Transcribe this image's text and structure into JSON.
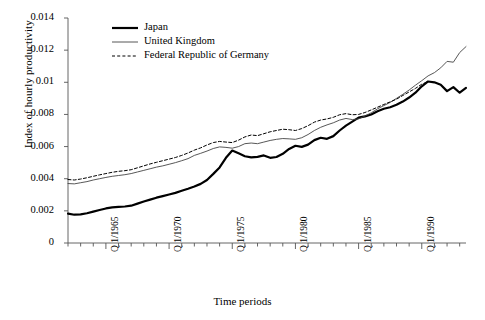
{
  "chart_data": {
    "type": "line",
    "title": "",
    "xlabel": "Time periods",
    "ylabel": "Index of hourly productivity",
    "ylim": [
      0,
      0.014
    ],
    "yticks": [
      "0",
      "0.002",
      "0.004",
      "0.006",
      "0.008",
      "0.01",
      "0.012",
      "0.014"
    ],
    "ytick_values": [
      0,
      0.002,
      0.004,
      0.006,
      0.008,
      0.01,
      0.012,
      0.014
    ],
    "xlim": [
      1962.0,
      1993.5
    ],
    "xticks": [
      "Q 1/1965",
      "Q 1/1970",
      "Q 1/1975",
      "Q 1/1980",
      "Q 1/1985",
      "Q 1/1990"
    ],
    "xtick_values": [
      1965,
      1970,
      1975,
      1980,
      1985,
      1990
    ],
    "minor_xtick_interval": 1,
    "grid": false,
    "legend_position": "top-left-inside",
    "series": [
      {
        "name": "Japan",
        "style": "solid-thick",
        "color": "#000000",
        "width": 2.2,
        "x": [
          1962.0,
          1962.5,
          1963.0,
          1963.5,
          1964.0,
          1964.5,
          1965.0,
          1965.5,
          1966.0,
          1966.5,
          1967.0,
          1967.5,
          1968.0,
          1968.5,
          1969.0,
          1969.5,
          1970.0,
          1970.5,
          1971.0,
          1971.5,
          1972.0,
          1972.5,
          1973.0,
          1973.5,
          1974.0,
          1974.5,
          1975.0,
          1975.5,
          1976.0,
          1976.5,
          1977.0,
          1977.5,
          1978.0,
          1978.5,
          1979.0,
          1979.5,
          1980.0,
          1980.5,
          1981.0,
          1981.5,
          1982.0,
          1982.5,
          1983.0,
          1983.5,
          1984.0,
          1984.5,
          1985.0,
          1985.5,
          1986.0,
          1986.5,
          1987.0,
          1987.5,
          1988.0,
          1988.5,
          1989.0,
          1989.5,
          1990.0,
          1990.5,
          1991.0,
          1991.5,
          1992.0,
          1992.5,
          1993.0,
          1993.5
        ],
        "y": [
          0.00183,
          0.00176,
          0.00178,
          0.00185,
          0.00195,
          0.00205,
          0.00215,
          0.00222,
          0.00225,
          0.00227,
          0.00232,
          0.00245,
          0.00258,
          0.0027,
          0.00282,
          0.00292,
          0.00302,
          0.00312,
          0.00325,
          0.00338,
          0.00352,
          0.00368,
          0.00392,
          0.0043,
          0.0047,
          0.0053,
          0.00575,
          0.00558,
          0.0054,
          0.00533,
          0.00536,
          0.00545,
          0.0053,
          0.00535,
          0.00555,
          0.00585,
          0.00605,
          0.00598,
          0.00612,
          0.0064,
          0.00655,
          0.00648,
          0.00665,
          0.007,
          0.0073,
          0.00755,
          0.0078,
          0.00788,
          0.008,
          0.0082,
          0.00835,
          0.00845,
          0.0086,
          0.0088,
          0.00905,
          0.00935,
          0.00975,
          0.01005,
          0.01,
          0.00985,
          0.00945,
          0.0097,
          0.00935,
          0.00965
        ]
      },
      {
        "name": "United Kingdom",
        "style": "solid-thin",
        "color": "#444444",
        "width": 0.9,
        "x": [
          1962.0,
          1962.5,
          1963.0,
          1963.5,
          1964.0,
          1964.5,
          1965.0,
          1965.5,
          1966.0,
          1966.5,
          1967.0,
          1967.5,
          1968.0,
          1968.5,
          1969.0,
          1969.5,
          1970.0,
          1970.5,
          1971.0,
          1971.5,
          1972.0,
          1972.5,
          1973.0,
          1973.5,
          1974.0,
          1974.5,
          1975.0,
          1975.5,
          1976.0,
          1976.5,
          1977.0,
          1977.5,
          1978.0,
          1978.5,
          1979.0,
          1979.5,
          1980.0,
          1980.5,
          1981.0,
          1981.5,
          1982.0,
          1982.5,
          1983.0,
          1983.5,
          1984.0,
          1984.5,
          1985.0,
          1985.5,
          1986.0,
          1986.5,
          1987.0,
          1987.5,
          1988.0,
          1988.5,
          1989.0,
          1989.5,
          1990.0,
          1990.5,
          1991.0,
          1991.5,
          1992.0,
          1992.5,
          1993.0,
          1993.5
        ],
        "y": [
          0.0037,
          0.00368,
          0.00375,
          0.00382,
          0.00392,
          0.004,
          0.00408,
          0.00415,
          0.0042,
          0.00425,
          0.00432,
          0.00442,
          0.00452,
          0.00462,
          0.00472,
          0.0048,
          0.0049,
          0.005,
          0.00512,
          0.00525,
          0.00545,
          0.00558,
          0.00572,
          0.00588,
          0.00598,
          0.00595,
          0.0059,
          0.006,
          0.00618,
          0.00622,
          0.00618,
          0.00628,
          0.00638,
          0.00645,
          0.0065,
          0.00648,
          0.00645,
          0.00655,
          0.00675,
          0.007,
          0.0072,
          0.00735,
          0.00748,
          0.00765,
          0.00775,
          0.00768,
          0.00772,
          0.0079,
          0.0081,
          0.00835,
          0.00855,
          0.00875,
          0.009,
          0.00925,
          0.00952,
          0.00982,
          0.0101,
          0.0104,
          0.0106,
          0.0109,
          0.0113,
          0.01125,
          0.01185,
          0.01222
        ]
      },
      {
        "name": "Federal Republic of Germany",
        "style": "dashed",
        "color": "#000000",
        "width": 1.0,
        "x": [
          1962.0,
          1962.5,
          1963.0,
          1963.5,
          1964.0,
          1964.5,
          1965.0,
          1965.5,
          1966.0,
          1966.5,
          1967.0,
          1967.5,
          1968.0,
          1968.5,
          1969.0,
          1969.5,
          1970.0,
          1970.5,
          1971.0,
          1971.5,
          1972.0,
          1972.5,
          1973.0,
          1973.5,
          1974.0,
          1974.5,
          1975.0,
          1975.5,
          1976.0,
          1976.5,
          1977.0,
          1977.5,
          1978.0,
          1978.5,
          1979.0,
          1979.5,
          1980.0,
          1980.5,
          1981.0,
          1981.5,
          1982.0,
          1982.5,
          1983.0,
          1983.5,
          1984.0,
          1984.5,
          1985.0,
          1985.5,
          1986.0,
          1986.5,
          1987.0,
          1987.5,
          1988.0,
          1988.5,
          1989.0,
          1989.5,
          1990.0,
          1990.5
        ],
        "y": [
          0.00395,
          0.00392,
          0.00398,
          0.00406,
          0.00415,
          0.00424,
          0.00432,
          0.0044,
          0.00446,
          0.0045,
          0.00456,
          0.00468,
          0.0048,
          0.00492,
          0.00502,
          0.00512,
          0.00522,
          0.00532,
          0.00545,
          0.0056,
          0.00578,
          0.00592,
          0.0061,
          0.00625,
          0.00632,
          0.00628,
          0.00625,
          0.0064,
          0.0066,
          0.00672,
          0.00668,
          0.0068,
          0.00692,
          0.007,
          0.00708,
          0.00705,
          0.007,
          0.00712,
          0.0073,
          0.00752,
          0.00765,
          0.00772,
          0.00782,
          0.00798,
          0.00805,
          0.00798,
          0.008,
          0.00812,
          0.00828,
          0.00845,
          0.00862,
          0.00878,
          0.00895,
          0.00918,
          0.0094,
          0.00962,
          0.00988,
          0.01005
        ]
      }
    ]
  },
  "legend": {
    "items": [
      {
        "label": "Japan"
      },
      {
        "label": "United Kingdom"
      },
      {
        "label": "Federal Republic of Germany"
      }
    ]
  }
}
